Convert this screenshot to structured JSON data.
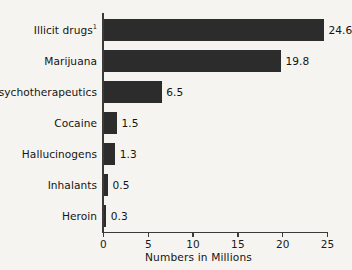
{
  "chart_data": {
    "type": "bar",
    "orientation": "horizontal",
    "title": "",
    "xlabel": "Numbers in Millions",
    "ylabel": "",
    "xlim": [
      0,
      25
    ],
    "grid": false,
    "legend": null,
    "bar_color": "#2c2c2c",
    "background_color": "#f6f4f0",
    "axis_color": "#3a3a3a",
    "xticks": [
      0,
      5,
      10,
      15,
      20,
      25
    ],
    "xtick_labels": [
      "0",
      "5",
      "10",
      "15",
      "20",
      "25"
    ],
    "categories": [
      "Illicit drugs",
      "Marijuana",
      "Psychotherapeutics",
      "Cocaine",
      "Hallucinogens",
      "Inhalants",
      "Heroin"
    ],
    "values": [
      24.6,
      19.8,
      6.5,
      1.5,
      1.3,
      0.5,
      0.3
    ],
    "value_labels": [
      "24.6",
      "19.8",
      "6.5",
      "1.5",
      "1.3",
      "0.5",
      "0.3"
    ],
    "footnote_markers": [
      "1",
      "",
      "",
      "",
      "",
      "",
      ""
    ],
    "bars": [
      {
        "category": "Illicit drugs",
        "footnote": "1",
        "value": 24.6,
        "label": "24.6"
      },
      {
        "category": "Marijuana",
        "footnote": "",
        "value": 19.8,
        "label": "19.8"
      },
      {
        "category": "Psychotherapeutics",
        "footnote": "",
        "value": 6.5,
        "label": "6.5"
      },
      {
        "category": "Cocaine",
        "footnote": "",
        "value": 1.5,
        "label": "1.5"
      },
      {
        "category": "Hallucinogens",
        "footnote": "",
        "value": 1.3,
        "label": "1.3"
      },
      {
        "category": "Inhalants",
        "footnote": "",
        "value": 0.5,
        "label": "0.5"
      },
      {
        "category": "Heroin",
        "footnote": "",
        "value": 0.3,
        "label": "0.3"
      }
    ]
  }
}
